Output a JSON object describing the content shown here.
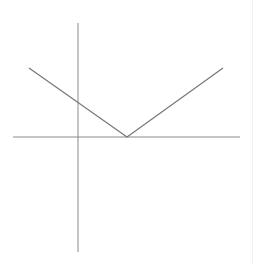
{
  "chart_data": {
    "type": "line",
    "title": "",
    "subtitle": "",
    "xlabel": "",
    "ylabel": "",
    "legend": [],
    "annotations": [],
    "grid": false,
    "ticks": {
      "x": [],
      "y": []
    },
    "interpretation": "Unlabeled absolute-value style V-shaped function on Cartesian axes with no ticks or tick labels. Numeric values are estimated by assuming a unit of about 24.5 px and placing the vertex at x=2 on the x-axis; these are not read from visible labels.",
    "estimated_function": "y = 0.7 * |x - 2|",
    "axis_ranges_estimated": {
      "xlim": [
        -2.7,
        6.6
      ],
      "ylim": [
        -4.7,
        4.6
      ]
    },
    "series": [
      {
        "name": "V-shaped piecewise linear function",
        "x": [
          -2.0,
          2.0,
          5.9
        ],
        "y": [
          2.8,
          0.0,
          2.8
        ]
      }
    ],
    "key_points_estimated": {
      "vertex": [
        2.0,
        0.0
      ],
      "y_intercept": [
        0.0,
        1.4
      ],
      "left_slope": -0.7,
      "right_slope": 0.7
    },
    "pixel_geometry": {
      "canvas": [
        258,
        265
      ],
      "x_axis": {
        "x1": 13,
        "y1": 137,
        "x2": 240,
        "y2": 137
      },
      "y_axis": {
        "x1": 78,
        "y1": 23,
        "x2": 78,
        "y2": 252
      },
      "polyline": [
        [
          29,
          68
        ],
        [
          127,
          137
        ],
        [
          223,
          68
        ]
      ]
    }
  },
  "style": {
    "background": "#ffffff",
    "axis_color": "#8a8a8a",
    "line_color": "#777777"
  }
}
